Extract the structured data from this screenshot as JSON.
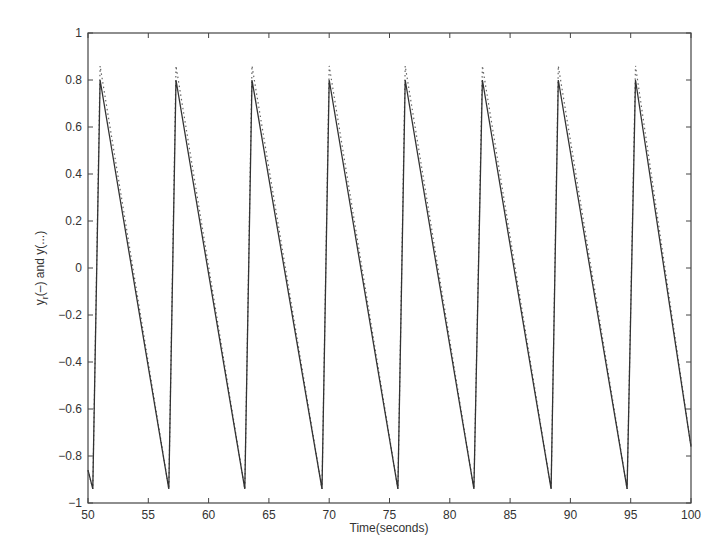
{
  "chart_data": {
    "type": "line",
    "title": "",
    "xlabel": "Time(seconds)",
    "ylabel": "y_r(–) and y(...)",
    "ylabel_parts": {
      "y1": "y",
      "sub": "r",
      "rest": "(–) and y(...)"
    },
    "xlim": [
      50,
      100
    ],
    "ylim": [
      -1,
      1
    ],
    "xticks": [
      50,
      55,
      60,
      65,
      70,
      75,
      80,
      85,
      90,
      95,
      100
    ],
    "xtick_labels": [
      "50",
      "55",
      "60",
      "65",
      "70",
      "75",
      "80",
      "85",
      "90",
      "95",
      "100"
    ],
    "yticks": [
      -1,
      -0.8,
      -0.6,
      -0.4,
      -0.2,
      0,
      0.2,
      0.4,
      0.6,
      0.8,
      1
    ],
    "ytick_labels": [
      "−1",
      "−0.8",
      "−0.6",
      "−0.4",
      "−0.2",
      "0",
      "0.2",
      "0.4",
      "0.6",
      "0.8",
      "1"
    ],
    "grid": false,
    "legend": null,
    "series": [
      {
        "name": "y_r (reference, solid)",
        "style": "solid",
        "x": [
          50,
          50.4,
          51.0,
          56.7,
          57.3,
          63.0,
          63.6,
          69.4,
          70.0,
          75.7,
          76.3,
          82.0,
          82.7,
          88.4,
          89.0,
          94.7,
          95.4,
          100
        ],
        "y": [
          -0.86,
          -0.94,
          0.8,
          -0.94,
          0.8,
          -0.94,
          0.8,
          -0.94,
          0.8,
          -0.94,
          0.8,
          -0.94,
          0.8,
          -0.94,
          0.8,
          -0.94,
          0.8,
          -0.76
        ]
      },
      {
        "name": "y (output, dotted)",
        "style": "dotted",
        "x": [
          50,
          50.4,
          51.0,
          56.7,
          57.3,
          63.0,
          63.6,
          69.4,
          70.0,
          75.7,
          76.3,
          82.0,
          82.7,
          88.4,
          89.0,
          94.7,
          95.4,
          100
        ],
        "y": [
          -0.86,
          -0.94,
          0.86,
          -0.94,
          0.86,
          -0.94,
          0.86,
          -0.94,
          0.86,
          -0.94,
          0.86,
          -0.94,
          0.86,
          -0.94,
          0.86,
          -0.94,
          0.86,
          -0.76
        ]
      }
    ],
    "colors": {
      "line": "#333333",
      "axis": "#444444",
      "background": "#ffffff"
    }
  }
}
